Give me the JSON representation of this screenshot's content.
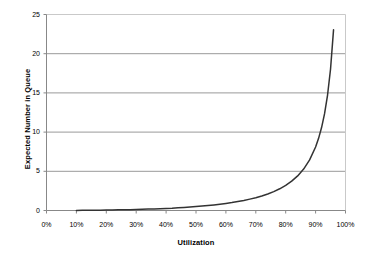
{
  "chart_data": {
    "type": "line",
    "title": "",
    "xlabel": "Utilization",
    "ylabel": "Expected Number in Queue",
    "xlim": [
      0,
      100
    ],
    "ylim": [
      0,
      25
    ],
    "grid": "horizontal",
    "legend": "none",
    "x_tick_labels": [
      "0%",
      "10%",
      "20%",
      "30%",
      "40%",
      "50%",
      "60%",
      "70%",
      "80%",
      "90%",
      "100%"
    ],
    "x_tick_values": [
      0,
      10,
      20,
      30,
      40,
      50,
      60,
      70,
      80,
      90,
      100
    ],
    "y_tick_labels": [
      "0",
      "5",
      "10",
      "15",
      "20",
      "25"
    ],
    "y_tick_values": [
      0,
      5,
      10,
      15,
      20,
      25
    ],
    "series": [
      {
        "name": "Expected Number in Queue",
        "color": "#333333",
        "x": [
          10,
          12,
          14,
          16,
          18,
          20,
          22,
          24,
          26,
          28,
          30,
          32,
          34,
          36,
          38,
          40,
          42,
          44,
          46,
          48,
          50,
          52,
          54,
          56,
          58,
          60,
          62,
          64,
          66,
          68,
          70,
          72,
          74,
          76,
          78,
          80,
          82,
          84,
          86,
          88,
          90,
          91,
          92,
          93,
          94,
          95,
          96
        ],
        "y": [
          0.01,
          0.02,
          0.02,
          0.03,
          0.04,
          0.05,
          0.06,
          0.08,
          0.09,
          0.11,
          0.13,
          0.15,
          0.18,
          0.2,
          0.23,
          0.27,
          0.3,
          0.35,
          0.39,
          0.44,
          0.5,
          0.56,
          0.63,
          0.71,
          0.8,
          0.9,
          1.01,
          1.14,
          1.28,
          1.45,
          1.63,
          1.85,
          2.11,
          2.41,
          2.77,
          3.2,
          3.74,
          4.41,
          5.28,
          6.45,
          8.1,
          9.2,
          10.58,
          12.35,
          14.73,
          18.05,
          23.04
        ],
        "formula": "Lq = rho^2 / (1 - rho)"
      }
    ],
    "axis_color": "#888888",
    "grid_color": "#999999",
    "background": "#ffffff"
  }
}
